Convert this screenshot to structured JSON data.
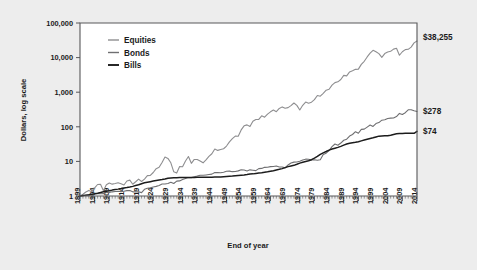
{
  "chart_data": {
    "type": "line",
    "title": "",
    "xlabel": "End of year",
    "ylabel": "Dollars, log scale",
    "log_y": true,
    "ylim": [
      1,
      100000
    ],
    "ytick_labels": [
      "100,000",
      "10,000",
      "1,000",
      "100",
      "10",
      "1"
    ],
    "ytick_values": [
      100000,
      10000,
      1000,
      100,
      10,
      1
    ],
    "xlim": [
      1899,
      2014
    ],
    "xtick_labels": [
      "1899",
      "1904",
      "1909",
      "1914",
      "1919",
      "1924",
      "1929",
      "1934",
      "1939",
      "1944",
      "1949",
      "1954",
      "1959",
      "1964",
      "1969",
      "1974",
      "1979",
      "1984",
      "1989",
      "1994",
      "1999",
      "2004",
      "2009",
      "2014"
    ],
    "minor_tick_interval_years": 1,
    "grid": false,
    "legend_position": "top-left-inside",
    "legend": [
      "Equities",
      "Bonds",
      "Bills"
    ],
    "end_labels": [
      "$38,255",
      "$278",
      "$74"
    ],
    "colors": {
      "equities": "#8e8e90",
      "bonds": "#6f6f71",
      "bills": "#1c1c1c",
      "axis": "#58585a",
      "plot_background": "#ffffff",
      "page_background": "#ededed",
      "text": "#1b1b1b"
    },
    "x": [
      1899,
      1900,
      1901,
      1902,
      1903,
      1904,
      1905,
      1906,
      1907,
      1908,
      1909,
      1910,
      1911,
      1912,
      1913,
      1914,
      1915,
      1916,
      1917,
      1918,
      1919,
      1920,
      1921,
      1922,
      1923,
      1924,
      1925,
      1926,
      1927,
      1928,
      1929,
      1930,
      1931,
      1932,
      1933,
      1934,
      1935,
      1936,
      1937,
      1938,
      1939,
      1940,
      1941,
      1942,
      1943,
      1944,
      1945,
      1946,
      1947,
      1948,
      1949,
      1950,
      1951,
      1952,
      1953,
      1954,
      1955,
      1956,
      1957,
      1958,
      1959,
      1960,
      1961,
      1962,
      1963,
      1964,
      1965,
      1966,
      1967,
      1968,
      1969,
      1970,
      1971,
      1972,
      1973,
      1974,
      1975,
      1976,
      1977,
      1978,
      1979,
      1980,
      1981,
      1982,
      1983,
      1984,
      1985,
      1986,
      1987,
      1988,
      1989,
      1990,
      1991,
      1992,
      1993,
      1994,
      1995,
      1996,
      1997,
      1998,
      1999,
      2000,
      2001,
      2002,
      2003,
      2004,
      2005,
      2006,
      2007,
      2008,
      2009,
      2010,
      2011,
      2012,
      2013,
      2014
    ],
    "series": [
      {
        "name": "Equities",
        "final_value": 38255,
        "values": [
          1,
          1.12,
          1.3,
          1.45,
          1.32,
          1.72,
          2.15,
          2.18,
          1.42,
          2.12,
          2.38,
          2.2,
          2.3,
          2.42,
          2.25,
          2.08,
          2.72,
          2.88,
          2.18,
          2.58,
          3.08,
          2.62,
          3.08,
          3.88,
          3.92,
          4.78,
          6.18,
          6.78,
          9.3,
          13.4,
          12.2,
          9.1,
          5.0,
          4.6,
          7.1,
          7.0,
          10.3,
          13.8,
          8.8,
          11.4,
          11.4,
          10.3,
          9.1,
          11.0,
          13.9,
          16.6,
          22.7,
          20.8,
          22.0,
          23.2,
          27.8,
          36.6,
          45.3,
          53.7,
          53.2,
          81.2,
          106.7,
          113.6,
          101.4,
          145.4,
          162.6,
          163.5,
          207.4,
          189.2,
          232.3,
          270.6,
          304.3,
          273.6,
          339.1,
          376.4,
          344.3,
          358.0,
          409.2,
          487.0,
          415.6,
          305.6,
          419.2,
          519.4,
          482.2,
          513.8,
          608.5,
          805.9,
          766.2,
          930.9,
          1141,
          1213,
          1597,
          1894,
          1993,
          2322,
          3057,
          2962,
          3863,
          4157,
          4574,
          4634,
          6374,
          7838,
          10451,
          13437,
          16259,
          14779,
          13019,
          10141,
          13048,
          14468,
          15177,
          17570,
          18533,
          11674,
          14766,
          16991,
          17346,
          20118,
          26625,
          30266
        ],
        "color": "#8e8e90",
        "width": 1.1
      },
      {
        "name": "Bonds",
        "final_value": 278,
        "values": [
          1,
          1.02,
          1.05,
          1.06,
          1.09,
          1.16,
          1.17,
          1.16,
          1.17,
          1.26,
          1.27,
          1.32,
          1.35,
          1.37,
          1.34,
          1.37,
          1.43,
          1.44,
          1.32,
          1.33,
          1.32,
          1.25,
          1.56,
          1.68,
          1.72,
          1.82,
          1.9,
          2.02,
          2.22,
          2.23,
          2.3,
          2.5,
          2.3,
          2.69,
          2.73,
          2.99,
          3.19,
          3.41,
          3.4,
          3.61,
          3.77,
          3.99,
          3.97,
          4.06,
          4.17,
          4.29,
          4.75,
          4.75,
          4.7,
          4.86,
          5.2,
          5.24,
          5.05,
          5.13,
          5.32,
          5.72,
          5.63,
          5.3,
          5.7,
          5.55,
          5.4,
          6.17,
          6.27,
          6.74,
          6.79,
          7.06,
          7.09,
          7.35,
          6.88,
          6.89,
          6.51,
          7.89,
          8.95,
          9.53,
          9.63,
          10.05,
          11.0,
          11.6,
          11.5,
          11.0,
          11.1,
          10.8,
          11.1,
          15.8,
          17.3,
          20.6,
          26.8,
          31.8,
          29.4,
          33.9,
          40.9,
          43.9,
          54.0,
          59.9,
          72.2,
          65.0,
          84.0,
          85.8,
          98.0,
          112.2,
          102.3,
          124.1,
          132.4,
          155.4,
          159.2,
          173.4,
          178.1,
          180.0,
          198.2,
          244.0,
          226.0,
          255.0,
          310.0,
          312.0,
          290.0,
          278
        ],
        "color": "#6f6f71",
        "width": 1.1
      },
      {
        "name": "Bills",
        "final_value": 74,
        "values": [
          1,
          1.03,
          1.06,
          1.09,
          1.13,
          1.16,
          1.2,
          1.26,
          1.33,
          1.38,
          1.42,
          1.48,
          1.53,
          1.58,
          1.64,
          1.71,
          1.76,
          1.82,
          1.9,
          2.0,
          2.11,
          2.27,
          2.41,
          2.5,
          2.6,
          2.7,
          2.79,
          2.89,
          2.98,
          3.1,
          3.25,
          3.32,
          3.36,
          3.39,
          3.4,
          3.41,
          3.42,
          3.43,
          3.44,
          3.45,
          3.46,
          3.47,
          3.48,
          3.49,
          3.5,
          3.51,
          3.53,
          3.55,
          3.57,
          3.61,
          3.65,
          3.7,
          3.76,
          3.84,
          3.92,
          4.0,
          4.06,
          4.16,
          4.3,
          4.36,
          4.5,
          4.62,
          4.72,
          4.85,
          4.99,
          5.17,
          5.38,
          5.64,
          5.89,
          6.19,
          6.6,
          7.06,
          7.38,
          7.69,
          8.25,
          8.92,
          9.44,
          9.9,
          10.43,
          11.2,
          12.4,
          13.9,
          15.9,
          17.7,
          19.3,
          21.2,
          22.8,
          24.1,
          25.4,
          27.2,
          29.5,
          31.8,
          33.6,
          34.7,
          35.7,
          37.2,
          39.2,
          41.3,
          43.6,
          45.9,
          48.1,
          50.9,
          53.7,
          54.5,
          54.9,
          55.5,
          57.2,
          59.9,
          62.7,
          64.3,
          64.5,
          64.6,
          64.7,
          64.8,
          65.0,
          74
        ],
        "color": "#1c1c1c",
        "width": 1.5
      }
    ]
  }
}
